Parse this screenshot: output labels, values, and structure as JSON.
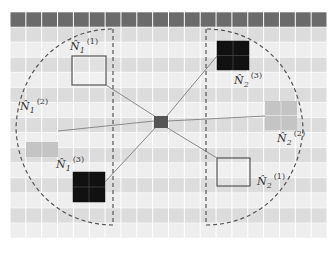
{
  "grid": {
    "left": 10,
    "top": 12,
    "cols": 20,
    "rows": 15,
    "cell_w": 15.85,
    "cell_h": 15.07,
    "header_color": "#6b6b6b",
    "row_colors": [
      "#dcdcdc",
      "#eeeeee"
    ],
    "line_color": "#ffffff"
  },
  "center": {
    "x": 154,
    "y": 116,
    "w": 14,
    "h": 12,
    "color": "#555555",
    "label": ""
  },
  "neighbors": [
    {
      "id": "n1_1",
      "label": "N̂",
      "sub": "1",
      "sup": "(1)",
      "style": "outline",
      "x": 72,
      "y": 56,
      "w": 34,
      "h": 29,
      "lx": 70,
      "ly": 50
    },
    {
      "id": "n1_2",
      "label": "N̂",
      "sub": "1",
      "sup": "(2)",
      "style": "gray",
      "x": 26,
      "y": 142,
      "w": 32,
      "h": 15,
      "lx": 20,
      "ly": 110
    },
    {
      "id": "n1_3",
      "label": "N̂",
      "sub": "1",
      "sup": "(3)",
      "style": "black",
      "x": 73,
      "y": 172,
      "w": 32,
      "h": 30,
      "lx": 56,
      "ly": 168
    },
    {
      "id": "n2_3",
      "label": "N̂",
      "sub": "2",
      "sup": "(3)",
      "style": "black",
      "x": 217,
      "y": 41,
      "w": 32,
      "h": 29,
      "lx": 234,
      "ly": 84
    },
    {
      "id": "n2_2",
      "label": "N̂",
      "sub": "2",
      "sup": "(2)",
      "style": "gray",
      "x": 265,
      "y": 101,
      "w": 32,
      "h": 29,
      "lx": 277,
      "ly": 142
    },
    {
      "id": "n2_1",
      "label": "N̂",
      "sub": "2",
      "sup": "(1)",
      "style": "outline",
      "x": 217,
      "y": 158,
      "w": 33,
      "h": 28,
      "lx": 257,
      "ly": 185
    }
  ],
  "edges": [
    {
      "from": "center",
      "to": "n1_1",
      "x1": 156,
      "y1": 117,
      "x2": 106,
      "y2": 85
    },
    {
      "from": "center",
      "to": "n1_2",
      "x1": 154,
      "y1": 121,
      "x2": 58,
      "y2": 131
    },
    {
      "from": "center",
      "to": "n1_3",
      "x1": 156,
      "y1": 127,
      "x2": 105,
      "y2": 182
    },
    {
      "from": "center",
      "to": "n2_3",
      "x1": 166,
      "y1": 117,
      "x2": 217,
      "y2": 56
    },
    {
      "from": "center",
      "to": "n2_2",
      "x1": 168,
      "y1": 121,
      "x2": 265,
      "y2": 116
    },
    {
      "from": "center",
      "to": "n2_1",
      "x1": 166,
      "y1": 127,
      "x2": 217,
      "y2": 158
    }
  ],
  "regions": [
    {
      "id": "group-1",
      "path": "M 113 29 L 113 225 C 60 225 18 185 16 128 C 18 70 60 29 113 29 Z"
    },
    {
      "id": "group-2",
      "path": "M 206 29 L 206 225 C 260 225 300 185 303 128 C 300 70 260 29 206 29 Z"
    }
  ]
}
